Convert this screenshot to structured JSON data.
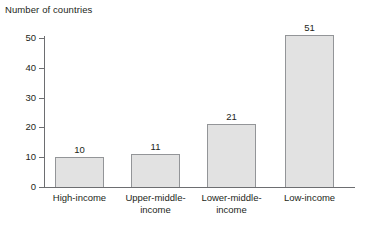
{
  "chart_data": {
    "type": "bar",
    "title": "Number of countries",
    "xlabel": "",
    "ylabel": "Number of countries",
    "categories": [
      "High-income",
      "Upper-middle-income",
      "Lower-middle-income",
      "Low-income"
    ],
    "category_lines": [
      [
        "High-income"
      ],
      [
        "Upper-middle-",
        "income"
      ],
      [
        "Lower-middle-",
        "income"
      ],
      [
        "Low-income"
      ]
    ],
    "values": [
      10,
      11,
      21,
      51
    ],
    "value_labels": [
      "10",
      "11",
      "21",
      "51"
    ],
    "ylim": [
      0,
      55
    ],
    "yticks": [
      0,
      10,
      20,
      30,
      40,
      50
    ],
    "ytick_labels": [
      "0",
      "10",
      "20",
      "30",
      "40",
      "50"
    ],
    "grid": false,
    "legend": false,
    "bar_fill": "#e2e2e2",
    "bar_border": "#939598",
    "axis_color": "#6d6e71",
    "text_color": "#231f20"
  }
}
